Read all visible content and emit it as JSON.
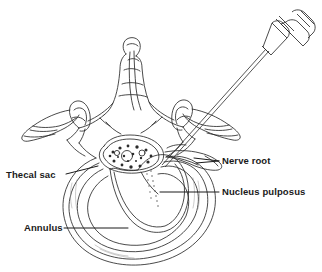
{
  "figure": {
    "type": "medical-line-illustration",
    "background_color": "#ffffff",
    "ink_color": "#2b2b2b",
    "shade_color": "#8d8d8d"
  },
  "labels": {
    "thecal_sac": "Thecal sac",
    "annulus": "Annulus",
    "nerve_root": "Nerve root",
    "nucleus_pulposus": "Nucleus pulposus"
  },
  "structures": {
    "spinous_process": "spinous-process",
    "transverse_process_left": "transverse-process-left",
    "transverse_process_right": "transverse-process-right",
    "superior_articular_facet_left": "superior-articular-facet-left",
    "superior_articular_facet_right": "superior-articular-facet-right",
    "lamina": "lamina",
    "pedicle": "pedicle",
    "thecal_sac": "thecal-sac",
    "nerve_rootlets": "nerve-rootlets-stipple",
    "annulus_fibrosus": "annulus-fibrosus",
    "nucleus_pulposus": "nucleus-pulposus",
    "exiting_nerve_root": "exiting-nerve-root",
    "needle_shaft": "needle-shaft",
    "needle_hub": "needle-hub",
    "syringe_connector": "syringe-connector"
  }
}
